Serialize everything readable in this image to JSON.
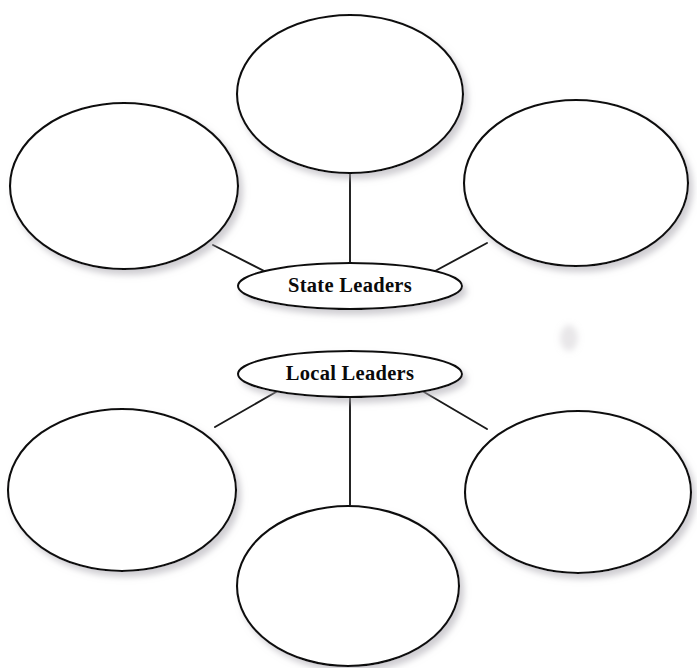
{
  "document": {
    "type": "graphic-organizer-worksheet",
    "title_remnant": "",
    "background_color": "#ffffff",
    "ink_color": "#111111",
    "shadow_color": "#b9b6bd",
    "width": 697,
    "height": 668
  },
  "clusters": [
    {
      "id": "state-leaders-web",
      "hub": {
        "label": "State Leaders",
        "cx": 350,
        "cy": 286,
        "rx": 112,
        "ry": 23
      },
      "satellites": [
        {
          "id": "state-top",
          "label": "",
          "cx": 350,
          "cy": 94,
          "rx": 113,
          "ry": 79
        },
        {
          "id": "state-left",
          "label": "",
          "cx": 124,
          "cy": 186,
          "rx": 114,
          "ry": 83
        },
        {
          "id": "state-right",
          "label": "",
          "cx": 576,
          "cy": 183,
          "rx": 112,
          "ry": 83
        }
      ],
      "connectors": [
        {
          "from": "state-top",
          "to": "hub",
          "x1": 350,
          "y1": 173,
          "x2": 350,
          "y2": 263
        },
        {
          "from": "state-left",
          "to": "hub",
          "x1": 213,
          "y1": 245,
          "x2": 276,
          "y2": 277
        },
        {
          "from": "state-right",
          "to": "hub",
          "x1": 487,
          "y1": 243,
          "x2": 424,
          "y2": 277
        }
      ]
    },
    {
      "id": "local-leaders-web",
      "hub": {
        "label": "Local Leaders",
        "cx": 350,
        "cy": 374,
        "rx": 112,
        "ry": 23
      },
      "satellites": [
        {
          "id": "local-left",
          "label": "",
          "cx": 122,
          "cy": 490,
          "rx": 114,
          "ry": 81
        },
        {
          "id": "local-right",
          "label": "",
          "cx": 578,
          "cy": 492,
          "rx": 113,
          "ry": 81
        },
        {
          "id": "local-bottom",
          "label": "",
          "cx": 348,
          "cy": 586,
          "rx": 111,
          "ry": 80
        }
      ],
      "connectors": [
        {
          "from": "hub",
          "to": "local-bottom",
          "x1": 350,
          "y1": 397,
          "x2": 350,
          "y2": 507
        },
        {
          "from": "hub",
          "to": "local-left",
          "x1": 276,
          "y1": 392,
          "x2": 215,
          "y2": 427
        },
        {
          "from": "hub",
          "to": "local-right",
          "x1": 424,
          "y1": 392,
          "x2": 487,
          "y2": 429
        }
      ]
    }
  ],
  "scan_artifacts": [
    {
      "id": "smudge-top-right",
      "cx": 570,
      "cy": 142,
      "rx": 19,
      "ry": 22
    },
    {
      "id": "smudge-mid-right",
      "cx": 569,
      "cy": 338,
      "rx": 9,
      "ry": 13
    },
    {
      "id": "smudge-bottom-right",
      "cx": 580,
      "cy": 462,
      "rx": 22,
      "ry": 15
    }
  ]
}
